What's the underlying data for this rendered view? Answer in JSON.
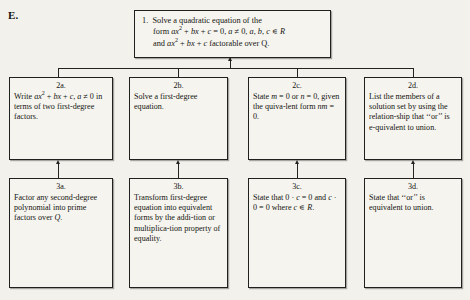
{
  "section": {
    "label": "E."
  },
  "diagram": {
    "type": "flowchart",
    "orientation": "bottom-up",
    "nodes": [
      {
        "id": "1",
        "number": "1.",
        "row": 0,
        "lines": [
          "Solve a quadratic equation of the",
          "form ax² + bx + c = 0, a ≠ 0, a, b, c ∊ R",
          "and ax² + bx + c factorable over Q."
        ],
        "text": "1. Solve a quadratic equation of the form ax² + bx + c = 0, a ≠ 0, a, b, c ∊ R and ax² + bx + c factorable over Q."
      },
      {
        "id": "2a",
        "number": "2a.",
        "row": 1,
        "text": "Write ax² + bx + c, a ≠ 0 in terms of two first-degree factors."
      },
      {
        "id": "2b",
        "number": "2b.",
        "row": 1,
        "text": "Solve a first-degree equation."
      },
      {
        "id": "2c",
        "number": "2c.",
        "row": 1,
        "text": "State m = 0 or n = 0, given the quiva-lent form mn = 0."
      },
      {
        "id": "2d",
        "number": "2d.",
        "row": 1,
        "text": "List the members of a solution set by using the relation-ship that ‘‘or’’ is e-quivalent to union."
      },
      {
        "id": "3a",
        "number": "3a.",
        "row": 2,
        "text": "Factor any second-degree polynomial into prime factors over Q."
      },
      {
        "id": "3b",
        "number": "3b.",
        "row": 2,
        "text": "Transform first-degree equation into equivalent forms by the addi-tion or multiplica-tion property of equality."
      },
      {
        "id": "3c",
        "number": "3c.",
        "row": 2,
        "text": "State that 0 · c = 0 and c · 0 = 0 where c ∊ R."
      },
      {
        "id": "3d",
        "number": "3d.",
        "row": 2,
        "text": "State that ‘‘or’’ is equivalent to union."
      }
    ],
    "edges": [
      {
        "from": "2a",
        "to": "1"
      },
      {
        "from": "2b",
        "to": "1"
      },
      {
        "from": "2c",
        "to": "1"
      },
      {
        "from": "2d",
        "to": "1"
      },
      {
        "from": "3a",
        "to": "2a"
      },
      {
        "from": "3b",
        "to": "2b"
      },
      {
        "from": "3c",
        "to": "2c"
      },
      {
        "from": "3d",
        "to": "2d"
      }
    ]
  }
}
